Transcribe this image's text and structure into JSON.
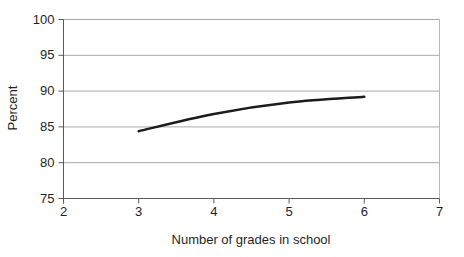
{
  "figure": {
    "title": "",
    "ylabel": "Percent",
    "xlabel": "Number of grades in school"
  },
  "chart_data": {
    "type": "line",
    "x": [
      3,
      4,
      5,
      6
    ],
    "series": [
      {
        "name": "Percent",
        "values": [
          84.4,
          86.8,
          88.4,
          89.2
        ]
      }
    ],
    "title": "",
    "xlabel": "Number of grades in school",
    "ylabel": "Percent",
    "xlim": [
      2,
      7
    ],
    "ylim": [
      75,
      100
    ],
    "x_ticks": [
      2,
      3,
      4,
      5,
      6,
      7
    ],
    "y_ticks": [
      75,
      80,
      85,
      90,
      95,
      100
    ],
    "grid": "horizontal",
    "legend": "none",
    "curve": "smooth",
    "line_width": 2.5,
    "colors": {
      "line": "#1c1c1c",
      "gridline": "#a8a8a8",
      "axis": "#5a5a5a",
      "plot_border": "#b8b8b8",
      "text": "#1f1f1f",
      "background": "#ffffff"
    }
  }
}
